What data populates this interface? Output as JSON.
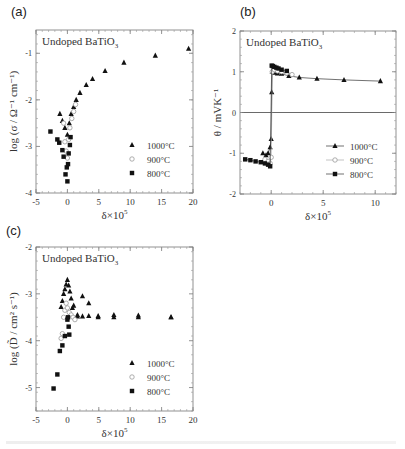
{
  "figure": {
    "panels": [
      "(a)",
      "(b)",
      "(c)"
    ]
  },
  "chart_data": [
    {
      "id": "a",
      "type": "scatter",
      "panel_label": "(a)",
      "title": "Undoped BaTiO3",
      "title_main": "Undoped BaTiO",
      "title_sub": "3",
      "xlabel": "δ×10^5",
      "ylabel": "log (σ / Ω⁻¹ cm⁻¹)",
      "xlim": [
        -5,
        20
      ],
      "ylim": [
        -4,
        -0.5
      ],
      "xticks": [
        -5,
        0,
        5,
        10,
        15,
        20
      ],
      "yticks": [
        -4,
        -3,
        -2,
        -1
      ],
      "grid": false,
      "legend_position": "lower right",
      "frame": {
        "x": 36,
        "y": 30,
        "w": 157,
        "h": 163
      },
      "series": [
        {
          "name": "1000°C",
          "marker": "triangle-filled",
          "x": [
            -1.2,
            -0.8,
            -0.4,
            0.0,
            0.3,
            0.6,
            1.0,
            1.4,
            2.0,
            3.0,
            4.0,
            6.0,
            9.0,
            14.0,
            19.3
          ],
          "y": [
            -2.3,
            -2.45,
            -2.6,
            -2.75,
            -2.5,
            -2.3,
            -2.15,
            -2.0,
            -1.85,
            -1.68,
            -1.55,
            -1.38,
            -1.2,
            -1.05,
            -0.9
          ]
        },
        {
          "name": "900°C",
          "marker": "circle-open",
          "x": [
            -0.6,
            -0.4,
            -0.2,
            0.0,
            0.2,
            0.4,
            0.7,
            1.0,
            1.3
          ],
          "y": [
            -2.5,
            -2.9,
            -3.1,
            -3.25,
            -2.85,
            -2.6,
            -2.4,
            -2.25,
            -2.1
          ]
        },
        {
          "name": "800°C",
          "marker": "square-filled",
          "x": [
            -2.7,
            -1.6,
            -1.3,
            -0.8,
            -0.6,
            -0.3,
            -0.1,
            0.0,
            0.1,
            0.2,
            0.4,
            0.5
          ],
          "y": [
            -2.68,
            -2.85,
            -2.92,
            -3.08,
            -3.22,
            -3.6,
            -3.45,
            -3.75,
            -3.38,
            -3.15,
            -2.97,
            -2.8
          ]
        }
      ]
    },
    {
      "id": "b",
      "type": "line",
      "panel_label": "(b)",
      "title": "Undoped BaTiO3",
      "title_main": "Undoped BaTiO",
      "title_sub": "3",
      "xlabel": "δ×10^5",
      "ylabel": "θ / mVK⁻¹",
      "xlim": [
        -3,
        12
      ],
      "ylim": [
        -2,
        2
      ],
      "xticks": [
        0,
        5,
        10
      ],
      "yticks": [
        -2,
        -1,
        0,
        1,
        2
      ],
      "zero_line": true,
      "grid": false,
      "legend_position": "lower right",
      "frame": {
        "x": 240,
        "y": 31,
        "w": 156,
        "h": 163
      },
      "series": [
        {
          "name": "1000°C",
          "marker": "triangle-filled",
          "x": [
            -0.8,
            -0.5,
            -0.3,
            -0.1,
            0.0,
            0.05,
            0.1,
            0.3,
            0.6,
            1.0,
            1.7,
            2.7,
            4.4,
            7.0,
            10.5
          ],
          "y": [
            -1.0,
            -1.05,
            -1.0,
            -0.85,
            -0.65,
            0.5,
            1.0,
            0.98,
            0.96,
            0.95,
            0.9,
            0.86,
            0.83,
            0.8,
            0.77
          ]
        },
        {
          "name": "900°C",
          "marker": "circle-open",
          "x": [
            -0.6,
            -0.3,
            -0.1,
            0.0,
            0.1,
            0.3,
            0.6,
            1.0,
            1.5,
            2.0
          ],
          "y": [
            -1.15,
            -1.2,
            -1.25,
            -1.1,
            1.0,
            1.05,
            1.02,
            1.0,
            0.97,
            0.93
          ]
        },
        {
          "name": "800°C",
          "marker": "square-filled",
          "x": [
            -2.5,
            -2.0,
            -1.5,
            -1.0,
            -0.6,
            -0.3,
            -0.1,
            0.05,
            0.15,
            0.3,
            0.5,
            0.7,
            1.0,
            1.5
          ],
          "y": [
            -1.15,
            -1.17,
            -1.2,
            -1.22,
            -1.25,
            -1.28,
            -1.32,
            1.15,
            1.14,
            1.12,
            1.1,
            1.08,
            1.05,
            1.02
          ]
        }
      ]
    },
    {
      "id": "c",
      "type": "scatter",
      "panel_label": "(c)",
      "title": "Undoped BaTiO3",
      "title_main": "Undoped BaTiO",
      "title_sub": "3",
      "xlabel": "δ×10^5",
      "ylabel": "log (D̃ / cm² s⁻¹)",
      "xlim": [
        -5,
        20
      ],
      "ylim": [
        -5.5,
        -2
      ],
      "xticks": [
        -5,
        0,
        5,
        10,
        15,
        20
      ],
      "yticks": [
        -5,
        -4,
        -3,
        -2
      ],
      "grid": false,
      "legend_position": "lower right",
      "frame": {
        "x": 36,
        "y": 247,
        "w": 157,
        "h": 164
      },
      "series": [
        {
          "name": "1000°C",
          "marker": "triangle-filled",
          "x": [
            -1.0,
            -0.8,
            -0.6,
            -0.4,
            -0.2,
            0.0,
            0.2,
            0.4,
            0.6,
            0.8,
            1.0,
            1.6,
            2.4,
            3.4,
            4.9,
            7.4,
            11.3,
            16.5
          ],
          "y": [
            -3.28,
            -3.15,
            -3.0,
            -2.9,
            -2.8,
            -2.7,
            -2.82,
            -2.95,
            -3.1,
            -3.3,
            -3.25,
            -3.48,
            -3.48,
            -3.47,
            -3.47,
            -3.45,
            -3.46,
            -3.5
          ],
          "extra_y": [
            -3.45,
            -3.05,
            -3.2,
            -3.5,
            -3.5,
            -3.5,
            -3.5
          ]
        },
        {
          "name": "900°C",
          "marker": "circle-open",
          "x": [
            -1.0,
            -0.8,
            -0.6,
            -0.4,
            -0.2,
            0.0,
            0.3,
            0.6,
            0.9,
            1.2
          ],
          "y": [
            -3.95,
            -3.85,
            -3.5,
            -3.35,
            -3.2,
            -3.3,
            -3.4,
            -3.45,
            -3.5,
            -3.55
          ]
        },
        {
          "name": "800°C",
          "marker": "square-filled",
          "x": [
            -2.2,
            -1.6,
            -1.2,
            -0.8,
            -0.4,
            0.0,
            0.1,
            0.2,
            0.3
          ],
          "y": [
            -5.02,
            -4.72,
            -4.22,
            -4.1,
            -3.9,
            -3.55,
            -3.5,
            -3.7,
            -3.87
          ]
        }
      ]
    }
  ]
}
